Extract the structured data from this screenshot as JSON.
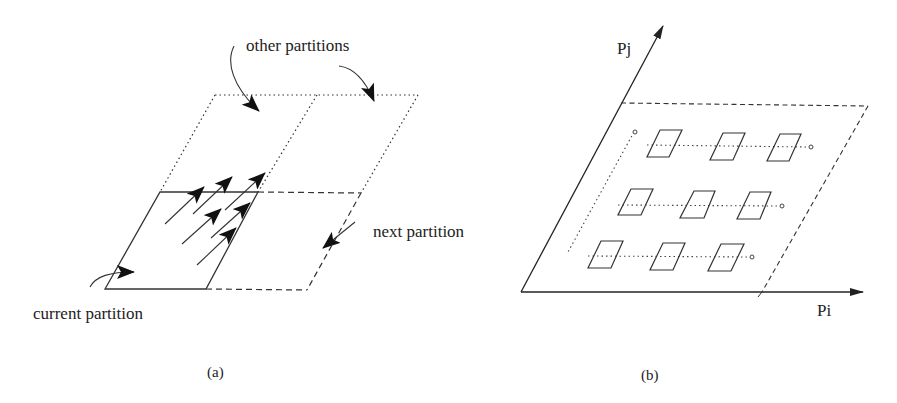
{
  "panel_a": {
    "caption": "(a)",
    "labels": {
      "other_partitions": "other partitions",
      "next_partition": "next partition",
      "current_partition": "current partition"
    }
  },
  "panel_b": {
    "caption": "(b)",
    "axes": {
      "x_label": "Pi",
      "y_label": "Pj"
    },
    "grid": {
      "rows": 3,
      "cols": 3
    }
  },
  "colors": {
    "stroke": "#222222",
    "background": "#ffffff"
  }
}
